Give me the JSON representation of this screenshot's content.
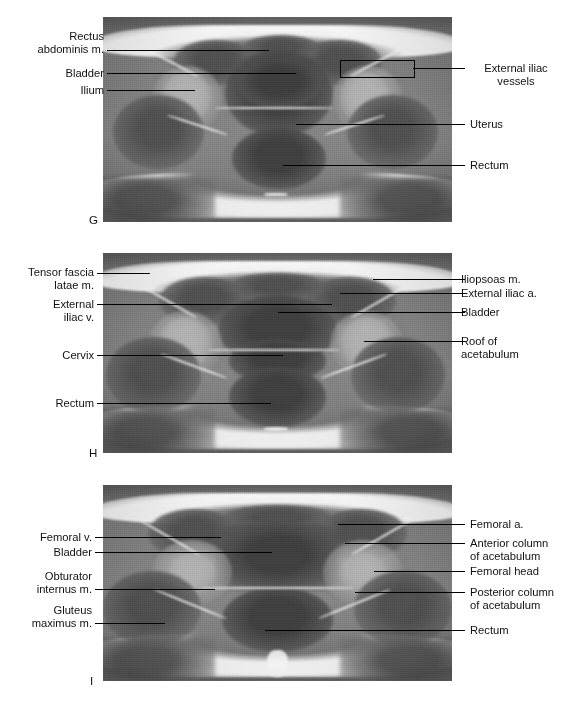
{
  "figure": {
    "background_color": "#ffffff",
    "text_color": "#111111",
    "leader_color": "#000000",
    "panels": [
      {
        "letter": "G",
        "modality": "axial MRI of the female pelvis",
        "labels_left": [
          {
            "text": "Rectus\nabdominis m."
          },
          {
            "text": "Bladder"
          },
          {
            "text": "Ilium"
          }
        ],
        "labels_right": [
          {
            "text": "External iliac\nvessels"
          },
          {
            "text": "Uterus"
          },
          {
            "text": "Rectum"
          }
        ]
      },
      {
        "letter": "H",
        "modality": "axial MRI of the female pelvis",
        "labels_left": [
          {
            "text": "Tensor fascia\nlatae m."
          },
          {
            "text": "External\niliac v."
          },
          {
            "text": "Cervix"
          },
          {
            "text": "Rectum"
          }
        ],
        "labels_right": [
          {
            "text": "Iliopsoas m."
          },
          {
            "text": "External iliac a."
          },
          {
            "text": "Bladder"
          },
          {
            "text": "Roof of\nacetabulum"
          }
        ]
      },
      {
        "letter": "I",
        "modality": "axial MRI of the female pelvis",
        "labels_left": [
          {
            "text": "Femoral v."
          },
          {
            "text": "Bladder"
          },
          {
            "text": "Obturator\ninternus m."
          },
          {
            "text": "Gluteus\nmaximus m."
          }
        ],
        "labels_right": [
          {
            "text": "Femoral a."
          },
          {
            "text": "Anterior column\nof acetabulum"
          },
          {
            "text": "Femoral head"
          },
          {
            "text": "Posterior column\nof acetabulum"
          },
          {
            "text": "Rectum"
          }
        ]
      }
    ]
  }
}
